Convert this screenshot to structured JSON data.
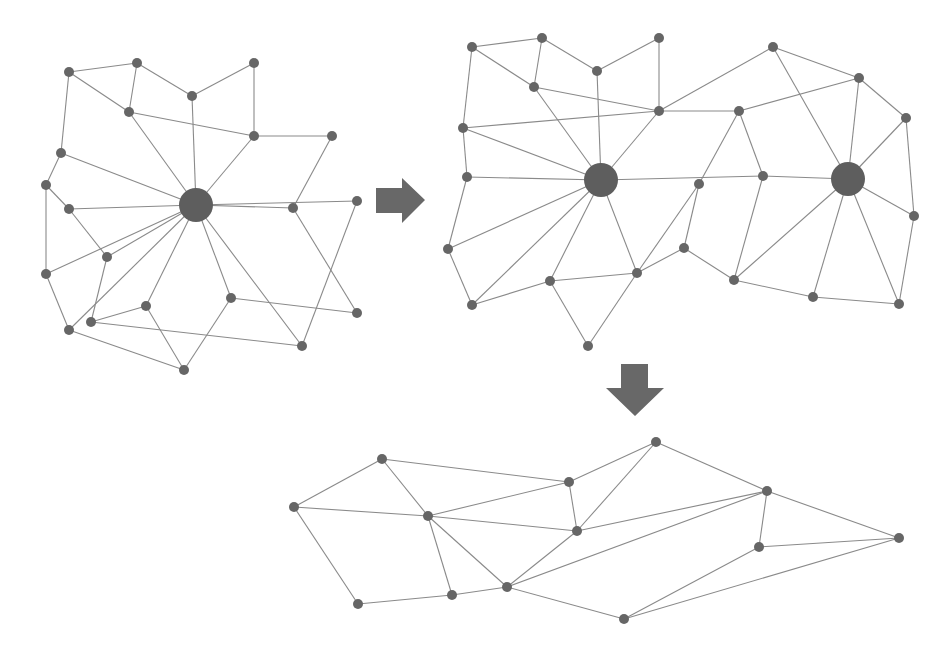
{
  "diagram": {
    "colors": {
      "node": "#666666",
      "hub": "#5e5e5e",
      "edge": "#8a8a8a",
      "arrow": "#686868",
      "background": "#ffffff"
    },
    "graphs": [
      {
        "id": "graph-single-hub",
        "description": "Network with one central hub",
        "nodes": [
          {
            "id": "A",
            "x": 69,
            "y": 72
          },
          {
            "id": "B",
            "x": 137,
            "y": 63
          },
          {
            "id": "C",
            "x": 192,
            "y": 96
          },
          {
            "id": "D",
            "x": 254,
            "y": 63
          },
          {
            "id": "E",
            "x": 129,
            "y": 112
          },
          {
            "id": "F",
            "x": 254,
            "y": 136
          },
          {
            "id": "G",
            "x": 332,
            "y": 136
          },
          {
            "id": "H",
            "x": 61,
            "y": 153
          },
          {
            "id": "I",
            "x": 46,
            "y": 185
          },
          {
            "id": "J",
            "x": 69,
            "y": 209
          },
          {
            "id": "HUB",
            "x": 196,
            "y": 205,
            "hub": true
          },
          {
            "id": "K",
            "x": 293,
            "y": 208
          },
          {
            "id": "L",
            "x": 357,
            "y": 201
          },
          {
            "id": "M",
            "x": 107,
            "y": 257
          },
          {
            "id": "N",
            "x": 46,
            "y": 274
          },
          {
            "id": "O",
            "x": 231,
            "y": 298
          },
          {
            "id": "P",
            "x": 146,
            "y": 306
          },
          {
            "id": "Q",
            "x": 91,
            "y": 322
          },
          {
            "id": "R",
            "x": 69,
            "y": 330
          },
          {
            "id": "S",
            "x": 357,
            "y": 313
          },
          {
            "id": "T",
            "x": 302,
            "y": 346
          },
          {
            "id": "U",
            "x": 184,
            "y": 370
          }
        ],
        "edges": [
          [
            "A",
            "B"
          ],
          [
            "A",
            "H"
          ],
          [
            "A",
            "E"
          ],
          [
            "B",
            "E"
          ],
          [
            "B",
            "C"
          ],
          [
            "C",
            "D"
          ],
          [
            "C",
            "HUB"
          ],
          [
            "D",
            "F"
          ],
          [
            "E",
            "F"
          ],
          [
            "E",
            "HUB"
          ],
          [
            "F",
            "G"
          ],
          [
            "F",
            "HUB"
          ],
          [
            "G",
            "K"
          ],
          [
            "H",
            "I"
          ],
          [
            "H",
            "HUB"
          ],
          [
            "I",
            "J"
          ],
          [
            "I",
            "N"
          ],
          [
            "J",
            "HUB"
          ],
          [
            "J",
            "M"
          ],
          [
            "HUB",
            "K"
          ],
          [
            "HUB",
            "L"
          ],
          [
            "HUB",
            "N"
          ],
          [
            "HUB",
            "M"
          ],
          [
            "HUB",
            "R"
          ],
          [
            "HUB",
            "P"
          ],
          [
            "HUB",
            "O"
          ],
          [
            "HUB",
            "T"
          ],
          [
            "K",
            "S"
          ],
          [
            "L",
            "T"
          ],
          [
            "M",
            "Q"
          ],
          [
            "P",
            "Q"
          ],
          [
            "P",
            "U"
          ],
          [
            "Q",
            "T"
          ],
          [
            "O",
            "S"
          ],
          [
            "O",
            "U"
          ],
          [
            "R",
            "U"
          ],
          [
            "N",
            "R"
          ]
        ]
      },
      {
        "id": "graph-two-hubs",
        "description": "Network with two hubs",
        "nodes": [
          {
            "id": "a",
            "x": 472,
            "y": 47
          },
          {
            "id": "b",
            "x": 542,
            "y": 38
          },
          {
            "id": "c",
            "x": 597,
            "y": 71
          },
          {
            "id": "d",
            "x": 659,
            "y": 38
          },
          {
            "id": "e",
            "x": 534,
            "y": 87
          },
          {
            "id": "f",
            "x": 659,
            "y": 111
          },
          {
            "id": "g",
            "x": 463,
            "y": 128
          },
          {
            "id": "h",
            "x": 467,
            "y": 177
          },
          {
            "id": "HUB1",
            "x": 601,
            "y": 180,
            "hub": true
          },
          {
            "id": "i",
            "x": 448,
            "y": 249
          },
          {
            "id": "j",
            "x": 550,
            "y": 281
          },
          {
            "id": "k",
            "x": 637,
            "y": 273
          },
          {
            "id": "l",
            "x": 684,
            "y": 248
          },
          {
            "id": "m",
            "x": 472,
            "y": 305
          },
          {
            "id": "x",
            "x": 588,
            "y": 346
          },
          {
            "id": "n",
            "x": 773,
            "y": 47
          },
          {
            "id": "o",
            "x": 859,
            "y": 78
          },
          {
            "id": "p",
            "x": 739,
            "y": 111
          },
          {
            "id": "q",
            "x": 906,
            "y": 118
          },
          {
            "id": "r",
            "x": 763,
            "y": 176
          },
          {
            "id": "s",
            "x": 699,
            "y": 184
          },
          {
            "id": "HUB2",
            "x": 848,
            "y": 179,
            "hub": true
          },
          {
            "id": "t",
            "x": 914,
            "y": 216
          },
          {
            "id": "u",
            "x": 734,
            "y": 280
          },
          {
            "id": "v",
            "x": 813,
            "y": 297
          },
          {
            "id": "w",
            "x": 899,
            "y": 304
          }
        ],
        "edges": [
          [
            "a",
            "b"
          ],
          [
            "a",
            "e"
          ],
          [
            "a",
            "g"
          ],
          [
            "b",
            "e"
          ],
          [
            "b",
            "c"
          ],
          [
            "c",
            "d"
          ],
          [
            "c",
            "HUB1"
          ],
          [
            "d",
            "f"
          ],
          [
            "e",
            "f"
          ],
          [
            "e",
            "HUB1"
          ],
          [
            "g",
            "f"
          ],
          [
            "f",
            "HUB1"
          ],
          [
            "f",
            "p"
          ],
          [
            "f",
            "n"
          ],
          [
            "g",
            "h"
          ],
          [
            "g",
            "HUB1"
          ],
          [
            "h",
            "HUB1"
          ],
          [
            "h",
            "i"
          ],
          [
            "i",
            "HUB1"
          ],
          [
            "i",
            "m"
          ],
          [
            "m",
            "HUB1"
          ],
          [
            "m",
            "j"
          ],
          [
            "j",
            "HUB1"
          ],
          [
            "j",
            "k"
          ],
          [
            "k",
            "HUB1"
          ],
          [
            "k",
            "s"
          ],
          [
            "k",
            "l"
          ],
          [
            "l",
            "u"
          ],
          [
            "j",
            "x"
          ],
          [
            "k",
            "x"
          ],
          [
            "HUB1",
            "r"
          ],
          [
            "p",
            "s"
          ],
          [
            "s",
            "l"
          ],
          [
            "n",
            "o"
          ],
          [
            "n",
            "HUB2"
          ],
          [
            "o",
            "p"
          ],
          [
            "o",
            "HUB2"
          ],
          [
            "o",
            "q"
          ],
          [
            "q",
            "HUB2"
          ],
          [
            "q",
            "t"
          ],
          [
            "t",
            "HUB2"
          ],
          [
            "t",
            "w"
          ],
          [
            "HUB2",
            "w"
          ],
          [
            "HUB2",
            "v"
          ],
          [
            "HUB2",
            "u"
          ],
          [
            "HUB2",
            "r"
          ],
          [
            "r",
            "p"
          ],
          [
            "r",
            "u"
          ],
          [
            "u",
            "v"
          ],
          [
            "v",
            "w"
          ]
        ]
      },
      {
        "id": "graph-no-hub",
        "description": "Network without hubs",
        "nodes": [
          {
            "id": "A3",
            "x": 382,
            "y": 459
          },
          {
            "id": "B3",
            "x": 294,
            "y": 507
          },
          {
            "id": "C3",
            "x": 428,
            "y": 516
          },
          {
            "id": "D3",
            "x": 569,
            "y": 482
          },
          {
            "id": "E3",
            "x": 577,
            "y": 531
          },
          {
            "id": "F3",
            "x": 358,
            "y": 604
          },
          {
            "id": "G3",
            "x": 452,
            "y": 595
          },
          {
            "id": "H3",
            "x": 507,
            "y": 587
          },
          {
            "id": "I3",
            "x": 656,
            "y": 442
          },
          {
            "id": "J3",
            "x": 767,
            "y": 491
          },
          {
            "id": "K3",
            "x": 899,
            "y": 538
          },
          {
            "id": "L3",
            "x": 759,
            "y": 547
          },
          {
            "id": "M3",
            "x": 624,
            "y": 619
          }
        ],
        "edges": [
          [
            "A3",
            "B3"
          ],
          [
            "A3",
            "D3"
          ],
          [
            "A3",
            "C3"
          ],
          [
            "B3",
            "C3"
          ],
          [
            "B3",
            "F3"
          ],
          [
            "C3",
            "D3"
          ],
          [
            "C3",
            "E3"
          ],
          [
            "C3",
            "G3"
          ],
          [
            "C3",
            "H3"
          ],
          [
            "D3",
            "E3"
          ],
          [
            "D3",
            "I3"
          ],
          [
            "E3",
            "I3"
          ],
          [
            "E3",
            "H3"
          ],
          [
            "E3",
            "J3"
          ],
          [
            "H3",
            "J3"
          ],
          [
            "H3",
            "M3"
          ],
          [
            "G3",
            "F3"
          ],
          [
            "G3",
            "H3"
          ],
          [
            "I3",
            "J3"
          ],
          [
            "J3",
            "K3"
          ],
          [
            "J3",
            "L3"
          ],
          [
            "L3",
            "K3"
          ],
          [
            "L3",
            "M3"
          ],
          [
            "M3",
            "K3"
          ]
        ]
      }
    ],
    "arrows": [
      {
        "id": "arrow-right",
        "direction": "right",
        "from": "graph-single-hub",
        "to": "graph-two-hubs"
      },
      {
        "id": "arrow-down",
        "direction": "down",
        "from": "graph-two-hubs",
        "to": "graph-no-hub"
      }
    ]
  }
}
